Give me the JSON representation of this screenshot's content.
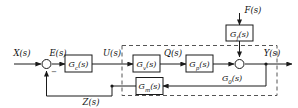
{
  "diagram": {
    "signals": {
      "input": "X(s)",
      "error": "E(s)",
      "control": "U(s)",
      "intermediate": "Q(s)",
      "disturbance": "F(s)",
      "output": "Y(s)",
      "feedback": "Z(s)"
    },
    "blocks": {
      "controller": "G_c(s)",
      "valve": "G_v(s)",
      "process": "G_p(s)",
      "measurement": "G_m(s)",
      "disturbance_path": "G_f(s)",
      "subsystem": "G_0(s)"
    },
    "signs": {
      "summing_negative": "−"
    },
    "colors": {
      "wire": "#1a1a1a",
      "dashed_boundary": "#555555",
      "background": "#ffffff",
      "text": "#111111"
    }
  }
}
